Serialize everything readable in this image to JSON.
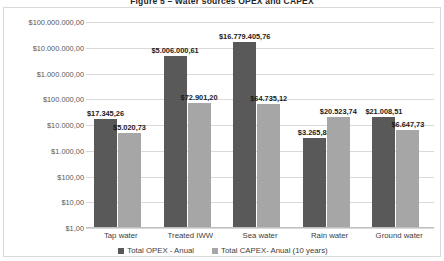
{
  "figure": {
    "title": "Figure 5 – Water sources OPEX and CAPEX"
  },
  "legend": {
    "items": [
      {
        "label": "Total OPEX - Anual",
        "color": "#595959"
      },
      {
        "label": "Total CAPEX- Anual (10 years)",
        "color": "#a6a6a6"
      }
    ]
  },
  "chart_data": {
    "type": "bar",
    "title": "Figure 5 – Water sources OPEX and CAPEX",
    "xlabel": "",
    "ylabel": "",
    "scale": "log",
    "grid": true,
    "legend_position": "bottom",
    "ylim": [
      1,
      100000000
    ],
    "ytick_labels": [
      "$100.000.000,00",
      "$10.000.000,00",
      "$1.000.000,00",
      "$100.000,00",
      "$10.000,00",
      "$1.000,00",
      "$100,00",
      "$10,00",
      "$1,00"
    ],
    "ytick_values": [
      100000000,
      10000000,
      1000000,
      100000,
      10000,
      1000,
      100,
      10,
      1
    ],
    "categories": [
      "Tap water",
      "Treated IWW",
      "Sea water",
      "Rain water",
      "Ground water"
    ],
    "series": [
      {
        "name": "Total OPEX - Anual",
        "color": "#595959",
        "values": [
          17345.26,
          5006000.61,
          16779405.76,
          3265.88,
          21008.51
        ],
        "labels": [
          "$17.345,26",
          "$5.006.000,61",
          "$16.779.405,76",
          "$3.265,88",
          "$21.008,51"
        ]
      },
      {
        "name": "Total CAPEX- Anual (10 years)",
        "color": "#a6a6a6",
        "values": [
          5020.73,
          72901.2,
          64735.12,
          20523.74,
          6647.73
        ],
        "labels": [
          "$5.020,73",
          "$72.901,20",
          "$64.735,12",
          "$20.523,74",
          "$6.647,73"
        ]
      }
    ]
  }
}
